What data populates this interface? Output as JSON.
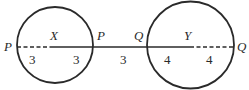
{
  "diagram": {
    "circles": [
      {
        "name": "X",
        "label": "X",
        "left_label": "P",
        "right_label": "P",
        "left_segment": "3",
        "right_segment": "3",
        "left_style": "dashed",
        "right_style": "solid"
      },
      {
        "name": "Y",
        "label": "Y",
        "left_label": "Q",
        "right_label": "Q",
        "left_segment": "4",
        "right_segment": "4",
        "left_style": "solid",
        "right_style": "dashed"
      }
    ],
    "connector_segment": "3",
    "stroke_color": "#2a2a2a"
  }
}
